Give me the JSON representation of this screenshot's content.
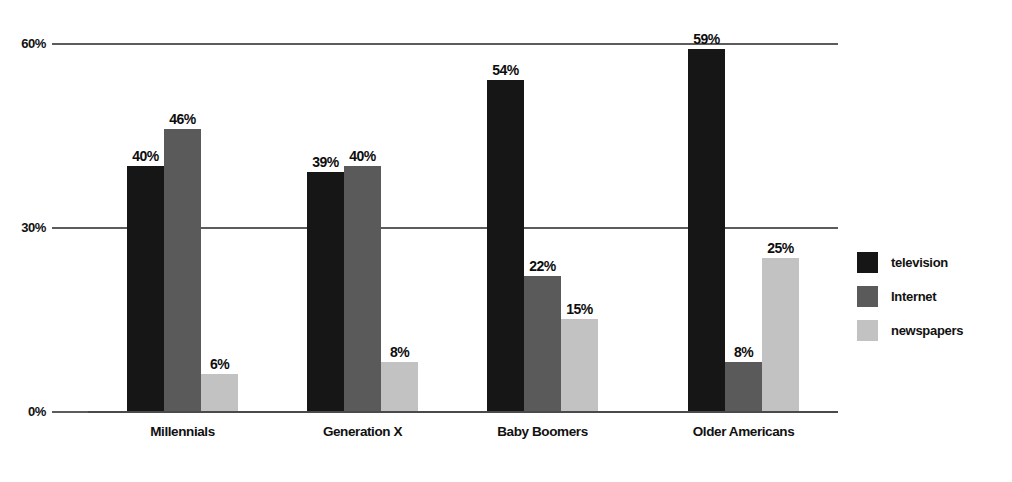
{
  "chart_data": {
    "type": "bar",
    "title": "",
    "subtitle": "",
    "xlabel": "",
    "ylabel": "",
    "ylim": [
      0,
      60
    ],
    "yticks": [
      "0%",
      "30%",
      "60%"
    ],
    "ytick_values": [
      0,
      30,
      60
    ],
    "grid": true,
    "legend_position": "right",
    "value_suffix": "%",
    "categories": [
      "Millennials",
      "Generation X",
      "Baby Boomers",
      "Older Americans"
    ],
    "series": [
      {
        "name": "television",
        "color": "#161616",
        "values": [
          40,
          39,
          54,
          59
        ],
        "labels": [
          "40%",
          "39%",
          "54%",
          "59%"
        ]
      },
      {
        "name": "Internet",
        "color": "#5a5a5a",
        "values": [
          46,
          40,
          22,
          8
        ],
        "labels": [
          "46%",
          "40%",
          "22%",
          "8%"
        ]
      },
      {
        "name": "newspapers",
        "color": "#c2c2c2",
        "values": [
          6,
          8,
          15,
          25
        ],
        "labels": [
          "6%",
          "8%",
          "15%",
          "25%"
        ]
      }
    ]
  },
  "axis": {
    "y_tick_60": "60%",
    "y_tick_30": "30%",
    "y_tick_0": "0%"
  },
  "categories": {
    "c0": "Millennials",
    "c1": "Generation X",
    "c2": "Baby Boomers",
    "c3": "Older Americans"
  },
  "legend": {
    "items": [
      {
        "label": "television",
        "color": "#161616"
      },
      {
        "label": "Internet",
        "color": "#5a5a5a"
      },
      {
        "label": "newspapers",
        "color": "#c2c2c2"
      }
    ]
  },
  "colors": {
    "gridline": "#5c5c5c",
    "axis": "#4a4a4a",
    "text": "#111111",
    "background": "#ffffff"
  }
}
